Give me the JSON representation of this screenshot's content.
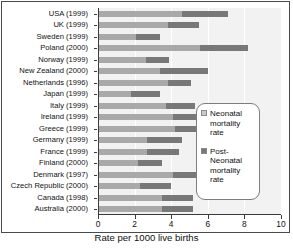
{
  "chart_data": {
    "type": "bar",
    "orientation": "horizontal",
    "stacked": true,
    "title": "",
    "xlabel": "Rate per 1000 live births",
    "ylabel": "",
    "xlim": [
      0,
      10
    ],
    "xticks": [
      0,
      2,
      4,
      6,
      8,
      10
    ],
    "xtick_labels": [
      "0",
      "2",
      "4",
      "6",
      "8",
      "10"
    ],
    "grid": "vertical",
    "legend_position": "right-inside",
    "categories": [
      "USA (1999)",
      "UK (1999)",
      "Sweden (1999)",
      "Poland (2000)",
      "Norway (1999)",
      "New Zealand (2000)",
      "Netherlands (1996)",
      "Japan (1999)",
      "Italy (1999)",
      "Ireland (1999)",
      "Greece (1999)",
      "Germany (1999)",
      "France (1999)",
      "Finland (2000)",
      "Denmark (1997)",
      "Czech Republic (2000)",
      "Canada (1998)",
      "Australia (2000)"
    ],
    "series": [
      {
        "name": "Neonatal mortality rate",
        "color": "#a9a9a9",
        "values": [
          4.6,
          3.8,
          2.1,
          5.6,
          2.6,
          3.4,
          3.8,
          1.8,
          3.7,
          4.1,
          4.2,
          2.7,
          2.7,
          2.2,
          4.1,
          2.3,
          3.5,
          3.5
        ]
      },
      {
        "name": "Post-Neonatal mortality rate",
        "color": "#787878",
        "values": [
          2.5,
          1.7,
          1.3,
          2.6,
          1.3,
          2.6,
          1.3,
          1.6,
          1.6,
          1.8,
          2.0,
          1.9,
          1.7,
          1.3,
          1.3,
          1.7,
          1.7,
          1.7
        ]
      }
    ],
    "totals": [
      7.1,
      5.5,
      3.4,
      8.2,
      3.9,
      6.0,
      5.1,
      3.4,
      5.3,
      5.9,
      6.2,
      4.6,
      4.4,
      3.5,
      5.4,
      4.0,
      5.2,
      5.2
    ]
  },
  "legend": {
    "entries": [
      {
        "label": "Neonatal mortality rate",
        "color": "#c9c9c9"
      },
      {
        "label": "Post-Neonatal mortality rate",
        "color": "#787878"
      }
    ]
  },
  "axis": {
    "x_title": "Rate per 1000 live births"
  }
}
